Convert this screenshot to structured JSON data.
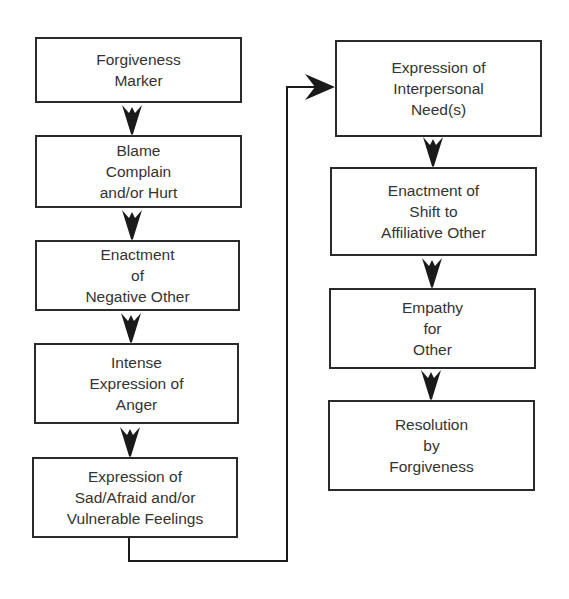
{
  "diagram": {
    "type": "flowchart",
    "colors": {
      "background": "#ffffff",
      "box_border": "#2a2a2a",
      "text": "#333333",
      "arrow": "#1a1a1a"
    },
    "left_column": [
      {
        "id": "forgiveness-marker",
        "label": "Forgiveness\nMarker"
      },
      {
        "id": "blame-complain-hurt",
        "label": "Blame\nComplain\nand/or Hurt"
      },
      {
        "id": "enactment-negative-other",
        "label": "Enactment\nof\nNegative Other"
      },
      {
        "id": "intense-expression-anger",
        "label": "Intense\nExpression of\nAnger"
      },
      {
        "id": "expression-sad-afraid-vulnerable",
        "label": "Expression of\nSad/Afraid and/or\nVulnerable Feelings"
      }
    ],
    "right_column": [
      {
        "id": "expression-interpersonal-needs",
        "label": "Expression of\nInterpersonal\nNeed(s)"
      },
      {
        "id": "enactment-shift-affiliative-other",
        "label": "Enactment of\nShift to\nAffiliative Other"
      },
      {
        "id": "empathy-for-other",
        "label": "Empathy\nfor\nOther"
      },
      {
        "id": "resolution-by-forgiveness",
        "label": "Resolution\nby\nForgiveness"
      }
    ],
    "edges": [
      {
        "from": "forgiveness-marker",
        "to": "blame-complain-hurt"
      },
      {
        "from": "blame-complain-hurt",
        "to": "enactment-negative-other"
      },
      {
        "from": "enactment-negative-other",
        "to": "intense-expression-anger"
      },
      {
        "from": "intense-expression-anger",
        "to": "expression-sad-afraid-vulnerable"
      },
      {
        "from": "expression-sad-afraid-vulnerable",
        "to": "expression-interpersonal-needs"
      },
      {
        "from": "expression-interpersonal-needs",
        "to": "enactment-shift-affiliative-other"
      },
      {
        "from": "enactment-shift-affiliative-other",
        "to": "empathy-for-other"
      },
      {
        "from": "empathy-for-other",
        "to": "resolution-by-forgiveness"
      }
    ]
  }
}
